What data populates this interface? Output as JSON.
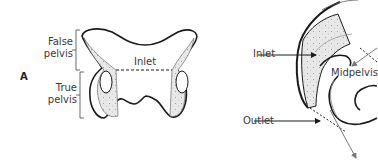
{
  "diagram": {
    "panel_a": {
      "letter": "A",
      "labels": {
        "false_pelvis_line1": "False",
        "false_pelvis_line2": "pelvis",
        "true_pelvis_line1": "True",
        "true_pelvis_line2": "pelvis",
        "inlet": "Inlet"
      }
    },
    "panel_b": {
      "labels": {
        "inlet": "Inlet",
        "midpelvis": "Midpelvis",
        "outlet": "Outlet"
      }
    },
    "colors": {
      "outline": "#1a1a1a",
      "bone_fill": "#e6e6e6",
      "arrow_gray": "#777777",
      "text": "#3a3a3a"
    }
  }
}
